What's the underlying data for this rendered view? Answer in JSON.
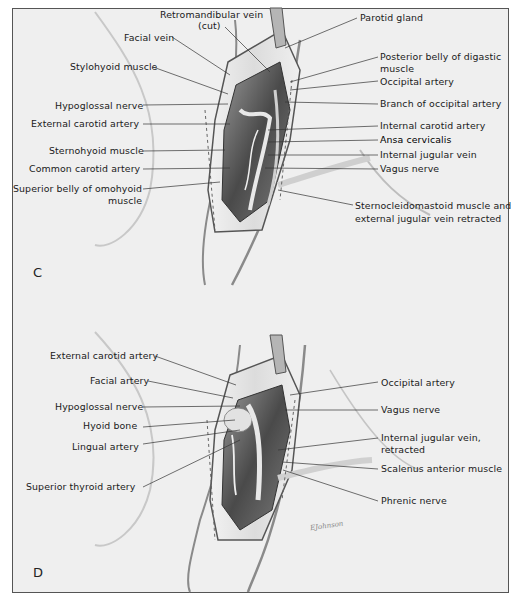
{
  "figure": {
    "panels": [
      {
        "letter": "C",
        "left_labels": [
          "Retromandibular vein",
          "(cut)",
          "Facial vein",
          "Stylohyoid muscle",
          "Hypoglossal nerve",
          "External carotid artery",
          "Sternohyoid muscle",
          "Common carotid artery",
          "Superior belly of omohyoid",
          "muscle"
        ],
        "right_labels": [
          "Parotid gland",
          "Posterior belly of digastic",
          "muscle",
          "Occipital artery",
          "Branch of occipital artery",
          "Internal carotid artery",
          "Ansa cervicalis",
          "Internal jugular vein",
          "Vagus nerve",
          "Sternocleidomastoid muscle and",
          "external jugular vein retracted"
        ]
      },
      {
        "letter": "D",
        "left_labels": [
          "External carotid artery",
          "Facial artery",
          "Hypoglossal nerve",
          "Hyoid bone",
          "Lingual artery",
          "Superior thyroid artery"
        ],
        "right_labels": [
          "Occipital artery",
          "Vagus nerve",
          "Internal jugular vein,",
          "retracted",
          "Scalenus anterior muscle",
          "Phrenic nerve"
        ],
        "signature": "EJohnson"
      }
    ]
  }
}
